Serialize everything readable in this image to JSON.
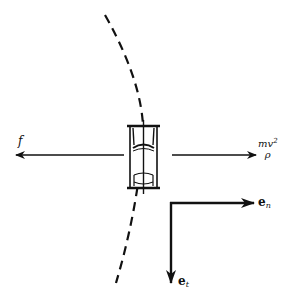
{
  "diagram": {
    "path": {
      "style": "dashed",
      "color": "#111111"
    },
    "car": {
      "orientation": "vertical",
      "view": "top"
    },
    "forces": {
      "friction": {
        "label": "f",
        "direction": "left"
      },
      "inertial": {
        "numerator": "mv",
        "exponent": "2",
        "denominator": "ρ",
        "direction": "right"
      }
    },
    "basis": {
      "normal": {
        "symbol": "e",
        "subscript": "n",
        "direction": "right"
      },
      "tangential": {
        "symbol": "e",
        "subscript": "t",
        "direction": "down"
      }
    },
    "colors": {
      "ink": "#111111",
      "background": "#ffffff"
    }
  }
}
